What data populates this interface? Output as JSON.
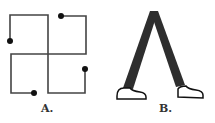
{
  "figures": [
    {
      "id": "A",
      "label": "A.",
      "description": "four interlocking open squares with dot endpoints (pinwheel)"
    },
    {
      "id": "B",
      "label": "B.",
      "description": "two dark legs forming an inverted V with white shoes (walking)"
    }
  ],
  "colors": {
    "line": "#444444",
    "dot": "#111111",
    "leg": "#2e2e2e",
    "shoe": "#ffffff",
    "background": "#ffffff"
  }
}
